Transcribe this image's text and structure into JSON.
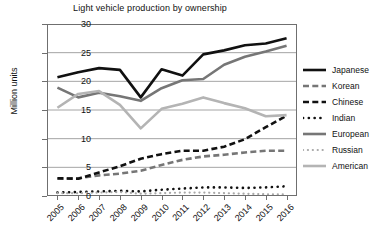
{
  "chart_data": {
    "type": "line",
    "title": "Light vehicle production by ownership",
    "xlabel": "",
    "ylabel": "Million units",
    "ylim": [
      0,
      30
    ],
    "yticks": [
      0,
      5,
      10,
      15,
      20,
      25,
      30
    ],
    "grid": true,
    "legend_position": "right",
    "categories": [
      "2005",
      "2006",
      "2007",
      "2008",
      "2009",
      "2010",
      "2011",
      "2012",
      "2013",
      "2014",
      "2015",
      "2016"
    ],
    "series": [
      {
        "name": "Japanese",
        "color": "#111111",
        "style": "solid",
        "width": 2.6,
        "values": [
          20.7,
          21.6,
          22.3,
          22.0,
          17.2,
          22.1,
          21.0,
          24.7,
          25.4,
          26.3,
          26.6,
          27.5
        ]
      },
      {
        "name": "Korean",
        "color": "#767676",
        "style": "dashed",
        "width": 2.6,
        "values": [
          3.0,
          3.1,
          3.6,
          3.9,
          4.4,
          5.4,
          6.3,
          6.9,
          7.2,
          7.6,
          7.9,
          7.9
        ]
      },
      {
        "name": "Chinese",
        "color": "#111111",
        "style": "dashed",
        "width": 2.6,
        "values": [
          3.1,
          3.0,
          4.1,
          5.2,
          6.5,
          7.3,
          7.9,
          7.9,
          8.6,
          9.9,
          12.0,
          14.0
        ]
      },
      {
        "name": "Indian",
        "color": "#111111",
        "style": "dotted",
        "width": 2.6,
        "values": [
          0.6,
          0.7,
          0.8,
          0.9,
          0.8,
          1.1,
          1.3,
          1.5,
          1.5,
          1.4,
          1.5,
          1.7
        ]
      },
      {
        "name": "European",
        "color": "#767676",
        "style": "solid",
        "width": 2.6,
        "values": [
          18.9,
          17.2,
          18.0,
          17.4,
          16.6,
          18.8,
          20.2,
          20.4,
          22.9,
          24.3,
          25.2,
          26.2
        ]
      },
      {
        "name": "Russian",
        "color": "#a8a8a8",
        "style": "dotted",
        "width": 2.2,
        "values": [
          0.5,
          0.5,
          0.6,
          0.7,
          0.4,
          0.5,
          0.6,
          0.6,
          0.5,
          0.4,
          0.3,
          0.3
        ]
      },
      {
        "name": "American",
        "color": "#b4b4b4",
        "style": "solid",
        "width": 2.6,
        "values": [
          15.4,
          17.8,
          18.3,
          15.9,
          11.8,
          15.2,
          16.1,
          17.2,
          16.2,
          15.3,
          13.9,
          14.1
        ]
      }
    ]
  },
  "legend": {
    "items": [
      {
        "label": "Japanese"
      },
      {
        "label": "Korean"
      },
      {
        "label": "Chinese"
      },
      {
        "label": "Indian"
      },
      {
        "label": "European"
      },
      {
        "label": "Russian"
      },
      {
        "label": "American"
      }
    ]
  }
}
